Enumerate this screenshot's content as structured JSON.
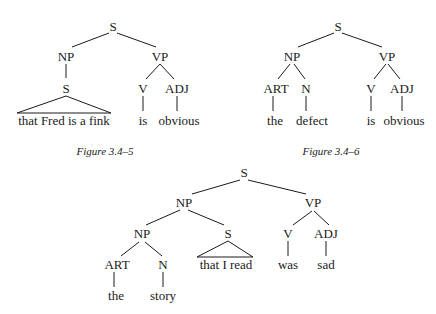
{
  "figures": [
    {
      "caption": "Figure 3.4–5",
      "nodes": {
        "root": "S",
        "np": "NP",
        "vp": "VP",
        "s_sub": "S",
        "v": "V",
        "adj": "ADJ"
      },
      "leaves": {
        "clause": "that Fred is a fink",
        "verb": "is",
        "adjective": "obvious"
      }
    },
    {
      "caption": "Figure 3.4–6",
      "nodes": {
        "root": "S",
        "np": "NP",
        "vp": "VP",
        "art": "ART",
        "n": "N",
        "v": "V",
        "adj": "ADJ"
      },
      "leaves": {
        "article": "the",
        "noun": "defect",
        "verb": "is",
        "adjective": "obvious"
      }
    },
    {
      "caption": "",
      "nodes": {
        "root": "S",
        "np": "NP",
        "vp": "VP",
        "np_inner": "NP",
        "s_rel": "S",
        "art": "ART",
        "n": "N",
        "v": "V",
        "adj": "ADJ"
      },
      "leaves": {
        "clause": "that I read",
        "article": "the",
        "noun": "story",
        "verb": "was",
        "adjective": "sad"
      }
    }
  ]
}
